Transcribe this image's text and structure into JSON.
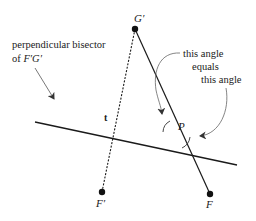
{
  "diagram": {
    "annotation_bisector": {
      "line1": "perpendicular bisector",
      "line2_prefix": "of ",
      "line2_segment": "F′G′"
    },
    "annotation_angles": {
      "line1": "this  angle",
      "line2": "equals",
      "line3": "this angle"
    },
    "points": {
      "G_prime": {
        "label": "G′"
      },
      "F_prime": {
        "label": "F′"
      },
      "F": {
        "label": "F"
      },
      "P": {
        "label": "P"
      },
      "t": {
        "label": "t"
      }
    },
    "colors": {
      "stroke": "#1a1a1a",
      "arrow": "#555555"
    }
  }
}
